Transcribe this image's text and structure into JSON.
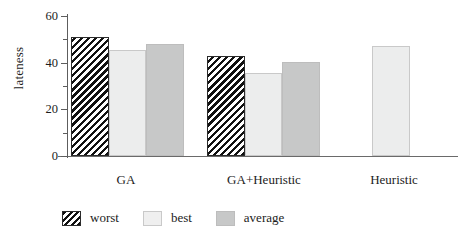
{
  "chart_data": {
    "type": "bar",
    "title": "",
    "xlabel": "",
    "ylabel": "lateness",
    "ylim": [
      0,
      60
    ],
    "yticks": [
      0,
      20,
      40,
      60
    ],
    "yminorticks": [
      10,
      30,
      50
    ],
    "grid": false,
    "legend_position": "bottom",
    "categories": [
      "GA",
      "GA+Heuristic",
      "Heuristic"
    ],
    "series": [
      {
        "name": "worst",
        "values": [
          51,
          43,
          null
        ]
      },
      {
        "name": "best",
        "values": [
          45.5,
          35.5,
          47
        ]
      },
      {
        "name": "average",
        "values": [
          48,
          40.5,
          null
        ]
      }
    ]
  },
  "axis": {
    "y_label": "lateness",
    "tick_0": "0",
    "tick_20": "20",
    "tick_40": "40",
    "tick_60": "60"
  },
  "categories": {
    "cat0": "GA",
    "cat1": "GA+Heuristic",
    "cat2": "Heuristic"
  },
  "legend": {
    "worst": "worst",
    "best": "best",
    "average": "average"
  },
  "colors": {
    "worst_hatch": "#111111",
    "best_fill": "#eceded",
    "average_fill": "#c7c8c8",
    "axis": "#5d5d5d",
    "text": "#1c1c1c"
  }
}
